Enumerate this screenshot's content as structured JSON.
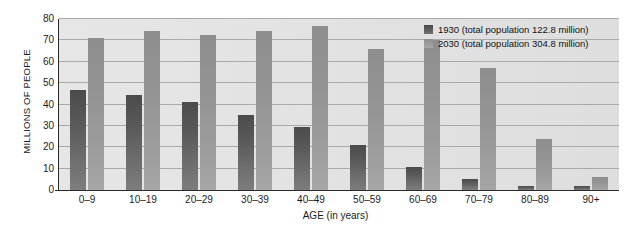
{
  "chart_data": {
    "type": "bar",
    "title": "",
    "xlabel": "AGE (in years)",
    "ylabel": "MILLIONS OF PEOPLE",
    "categories": [
      "0–9",
      "10–19",
      "20–29",
      "30–39",
      "40–49",
      "50–59",
      "60–69",
      "70–79",
      "80–89",
      "90+"
    ],
    "series": [
      {
        "name": "1930 (total population 122.8 million)",
        "short_name": "1930",
        "color": "#5a5a5a",
        "values": [
          47,
          44.5,
          41,
          35,
          29.5,
          21,
          11,
          5,
          2,
          2
        ]
      },
      {
        "name": "2030 (total population 304.8 million)",
        "short_name": "2030",
        "color": "#9a9a9a",
        "values": [
          71,
          74.5,
          72.5,
          74.5,
          76.5,
          66,
          70,
          57,
          24,
          6
        ]
      }
    ],
    "ylim": [
      0,
      80
    ],
    "yticks": [
      0,
      10,
      20,
      30,
      40,
      50,
      60,
      70,
      80
    ],
    "ytick_labels": [
      "0",
      "10",
      "20",
      "30",
      "40",
      "50",
      "60",
      "70",
      "80"
    ],
    "grid": true,
    "grid_axis": "y",
    "legend_position": "top-right",
    "plot_background": "#e4e4e4"
  },
  "legend": {
    "entries": [
      {
        "label": "1930 (total population 122.8 million)"
      },
      {
        "label": "2030 (total population 304.8 million)"
      }
    ]
  },
  "axes": {
    "y_title": "MILLIONS OF PEOPLE",
    "x_title": "AGE (in years)"
  }
}
